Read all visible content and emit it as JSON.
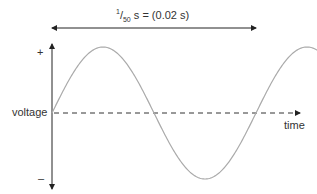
{
  "diagram": {
    "period_label": {
      "frac_num": "1",
      "frac_den": "50",
      "unit_rest": " s = (0.02 s)"
    },
    "y_axis": {
      "label": "voltage",
      "plus": "+",
      "minus": "–"
    },
    "x_axis": {
      "label": "time"
    },
    "colors": {
      "axis": "#222222",
      "wave": "#aaaaaa",
      "dash": "#333333"
    }
  }
}
